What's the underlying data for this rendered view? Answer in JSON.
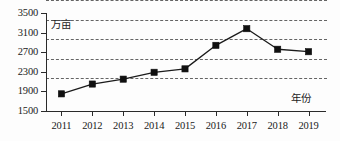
{
  "chart_data": {
    "type": "line",
    "title": "",
    "subtitle": "",
    "xlabel": "年份",
    "ylabel": "万亩",
    "unit_note": "万亩",
    "categories": [
      "2011",
      "2012",
      "2013",
      "2014",
      "2015",
      "2016",
      "2017",
      "2018",
      "2019"
    ],
    "values": [
      1850,
      2050,
      2150,
      2290,
      2360,
      2840,
      3180,
      2760,
      2710
    ],
    "series": [
      {
        "name": "面积",
        "values": [
          1850,
          2050,
          2150,
          2290,
          2360,
          2840,
          3180,
          2760,
          2710
        ]
      }
    ],
    "yticks": [
      1500,
      1900,
      2300,
      2700,
      3100,
      3500
    ],
    "ytick_labels": [
      "1500",
      "1900",
      "2300",
      "2700",
      "3100",
      "3500"
    ],
    "ylim": [
      1500,
      3500
    ],
    "xtick_labels": [
      "2011",
      "2012",
      "2013",
      "2014",
      "2015",
      "2016",
      "2017",
      "2018",
      "2019"
    ],
    "grid": true,
    "grid_style": "dashed-horizontal",
    "legend": "none",
    "marker": "filled-square",
    "line_color": "#1b1b1b",
    "marker_color": "#101010",
    "grid_color": "#4a4a4a",
    "axis_color": "#2a2a2a",
    "background": "#fdfdfd"
  }
}
